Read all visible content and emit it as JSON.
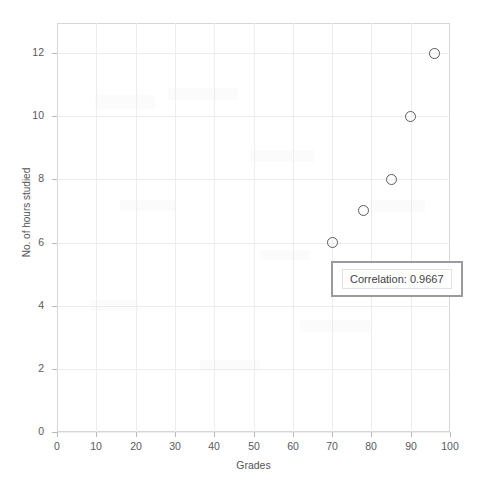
{
  "top_caption": "",
  "chart_data": {
    "type": "scatter",
    "title": "",
    "xlabel": "Grades",
    "ylabel": "No. of hours studied",
    "xlim": [
      0,
      100
    ],
    "ylim": [
      0,
      12.95
    ],
    "xticks": [
      0,
      10,
      20,
      30,
      40,
      50,
      60,
      70,
      80,
      90,
      100
    ],
    "yticks": [
      0,
      2,
      4,
      6,
      8,
      10,
      12
    ],
    "xtick_labels": [
      "0",
      "10",
      "20",
      "30",
      "40",
      "50",
      "60",
      "70",
      "80",
      "90",
      "100"
    ],
    "ytick_labels": [
      "0",
      "2",
      "4",
      "6",
      "8",
      "10",
      "12"
    ],
    "grid": true,
    "legend": null,
    "marker_style": "open-circle",
    "marker_color": "#5a5a60",
    "points": [
      {
        "x": 70,
        "y": 6
      },
      {
        "x": 78,
        "y": 7
      },
      {
        "x": 85,
        "y": 8
      },
      {
        "x": 90,
        "y": 10
      },
      {
        "x": 96,
        "y": 12
      }
    ],
    "annotations": [
      {
        "name": "correlation-box",
        "text": "Correlation: 0.9667",
        "x": 71,
        "y": 5.1
      }
    ]
  },
  "annotation": {
    "correlation_text": "Correlation: 0.9667"
  },
  "colors": {
    "frame": "#d6d6da",
    "grid": "#ededf0",
    "marker": "#5a5a60",
    "text": "#55555a",
    "annotation_border": "#9a9aa0"
  }
}
